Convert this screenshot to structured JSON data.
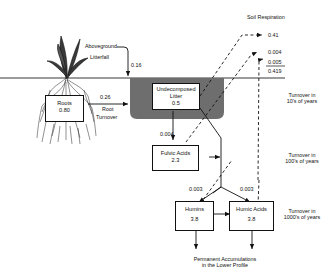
{
  "diagram": {
    "title_label": "Soil Respiration",
    "aboveground": {
      "line1": "Aboveground",
      "line2": "Litterfall",
      "flux": "0.16"
    },
    "root_turnover": {
      "line1": "Root",
      "line2": "Turnover",
      "flux": "0.26"
    },
    "pools": {
      "roots": {
        "name": "Roots",
        "value": "0.80"
      },
      "litter": {
        "name1": "Undecomposed",
        "name2": "Litter",
        "value": "0.5"
      },
      "fulvic": {
        "name": "Fulvic Acids",
        "value": "2.3"
      },
      "humins": {
        "name": "Humins",
        "value": "3.8"
      },
      "humic": {
        "name": "Humic Acids",
        "value": "3.8"
      }
    },
    "fluxes": {
      "litter_to_fulvic": "0.004",
      "to_humins": "0.003",
      "to_humic": "0.003"
    },
    "respiration": {
      "r1": "0.41",
      "r2": "0.004",
      "r3": "0.005",
      "total": "0.419"
    },
    "turnover": {
      "t1": {
        "line1": "Turnover in",
        "line2": "10's of years"
      },
      "t2": {
        "line1": "Turnover in",
        "line2": "100's of years"
      },
      "t3": {
        "line1": "Turnover in",
        "line2": "1000's of years"
      }
    },
    "bottom": {
      "line1": "Permanent Accumulations",
      "line2": "in the Lower Profile"
    },
    "colors": {
      "litter_shade": "#6e6e6e",
      "line": "#111111"
    }
  }
}
